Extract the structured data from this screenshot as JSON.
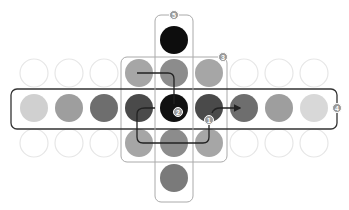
{
  "grid": {
    "columns": 9,
    "col_x": [
      34,
      69,
      104,
      139,
      174,
      209,
      244,
      279,
      314
    ],
    "row_y": [
      40,
      73,
      108,
      143,
      178
    ],
    "radius": 14
  },
  "colors": {
    "empty_stroke": "#e6e6e6",
    "frame_dark": "#333333",
    "frame_light": "#aaaaaa",
    "path": "#222222",
    "badge_fill": "#999999"
  },
  "cells": [
    {
      "row": 0,
      "col": 4,
      "fill": "#0d0d0d",
      "label": "top"
    },
    {
      "row": 1,
      "col": 0,
      "fill": "none"
    },
    {
      "row": 1,
      "col": 1,
      "fill": "none"
    },
    {
      "row": 1,
      "col": 2,
      "fill": "none"
    },
    {
      "row": 1,
      "col": 3,
      "fill": "#a6a6a6"
    },
    {
      "row": 1,
      "col": 4,
      "fill": "#8c8c8c"
    },
    {
      "row": 1,
      "col": 5,
      "fill": "#a6a6a6"
    },
    {
      "row": 1,
      "col": 6,
      "fill": "none"
    },
    {
      "row": 1,
      "col": 7,
      "fill": "none"
    },
    {
      "row": 1,
      "col": 8,
      "fill": "none"
    },
    {
      "row": 2,
      "col": 0,
      "fill": "#d0d0d0"
    },
    {
      "row": 2,
      "col": 1,
      "fill": "#9e9e9e"
    },
    {
      "row": 2,
      "col": 2,
      "fill": "#6e6e6e"
    },
    {
      "row": 2,
      "col": 3,
      "fill": "#4a4a4a"
    },
    {
      "row": 2,
      "col": 4,
      "fill": "#111111"
    },
    {
      "row": 2,
      "col": 5,
      "fill": "#4a4a4a"
    },
    {
      "row": 2,
      "col": 6,
      "fill": "#6e6e6e"
    },
    {
      "row": 2,
      "col": 7,
      "fill": "#9e9e9e"
    },
    {
      "row": 2,
      "col": 8,
      "fill": "#d8d8d8"
    },
    {
      "row": 3,
      "col": 0,
      "fill": "none"
    },
    {
      "row": 3,
      "col": 1,
      "fill": "none"
    },
    {
      "row": 3,
      "col": 2,
      "fill": "none"
    },
    {
      "row": 3,
      "col": 3,
      "fill": "#a6a6a6"
    },
    {
      "row": 3,
      "col": 4,
      "fill": "#8c8c8c"
    },
    {
      "row": 3,
      "col": 5,
      "fill": "#a6a6a6"
    },
    {
      "row": 3,
      "col": 6,
      "fill": "none"
    },
    {
      "row": 3,
      "col": 7,
      "fill": "none"
    },
    {
      "row": 3,
      "col": 8,
      "fill": "none"
    },
    {
      "row": 4,
      "col": 4,
      "fill": "#7a7a7a"
    }
  ],
  "frames": [
    {
      "id": "3",
      "label": "3",
      "x": 121,
      "y": 57,
      "w": 106,
      "h": 105,
      "style": "light",
      "badge_x": 223,
      "badge_y": 57
    },
    {
      "id": "4",
      "label": "4",
      "x": 11,
      "y": 89,
      "w": 326,
      "h": 40,
      "style": "dark",
      "badge_x": 337,
      "badge_y": 108
    },
    {
      "id": "5",
      "label": "5",
      "x": 155,
      "y": 15,
      "w": 38,
      "h": 187,
      "style": "light",
      "badge_x": 174,
      "badge_y": 15
    }
  ],
  "badges": [
    {
      "id": "1",
      "label": "1",
      "x": 209,
      "y": 120
    },
    {
      "id": "2",
      "label": "2",
      "x": 178,
      "y": 112
    }
  ],
  "paths": {
    "top_path": "M137 73 L168 73 Q174 73 174 79 L174 104",
    "loop_path": "M155 108 L145 108 Q137 108 137 114 L137 137 Q137 143 143 143 L203 143 Q209 143 209 137 L209 124",
    "arrow_path": "M212 113 Q214 108 220 108 L240 108"
  }
}
